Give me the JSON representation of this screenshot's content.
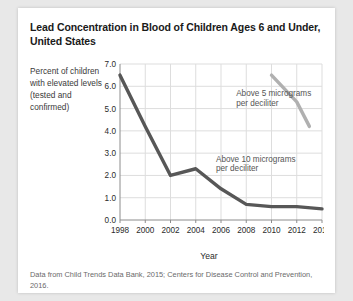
{
  "card": {
    "title": "Lead Concentration in Blood of Children Ages 6 and Under, United States",
    "source_note": "Data from Child Trends Data Bank, 2015; Centers for Disease Control and Prevention, 2016."
  },
  "chart_data": {
    "type": "line",
    "title": "Lead Concentration in Blood of Children Ages 6 and Under, United States",
    "xlabel": "Year",
    "ylabel": "Percent of children with elevated levels (tested and confirmed)",
    "xlim": [
      1998,
      2014
    ],
    "ylim": [
      0.0,
      7.0
    ],
    "grid": true,
    "legend_position": "inline-annotations",
    "x_ticks": [
      "1998",
      "2000",
      "2002",
      "2004",
      "2006",
      "2008",
      "2010",
      "2012",
      "2014"
    ],
    "y_ticks": [
      "0.0",
      "1.0",
      "2.0",
      "3.0",
      "4.0",
      "5.0",
      "6.0",
      "7.0"
    ],
    "series": [
      {
        "name": "Above 10 micrograms per deciliter",
        "color": "#575757",
        "annotation": "Above 10 micrograms per deciliter",
        "x": [
          1998,
          2000,
          2002,
          2004,
          2006,
          2008,
          2010,
          2012,
          2014
        ],
        "values": [
          6.5,
          4.2,
          2.0,
          2.3,
          1.4,
          0.7,
          0.6,
          0.6,
          0.5
        ]
      },
      {
        "name": "Above 5 micrograms per deciliter",
        "color": "#b0b0b0",
        "annotation": "Above 5 micrograms per deciliter",
        "x": [
          2010,
          2012,
          2013
        ],
        "values": [
          6.5,
          5.3,
          4.2
        ]
      }
    ],
    "annotations": [
      {
        "text_line1": "Above 5 micrograms",
        "text_line2": "per deciliter",
        "x": 2007.2,
        "y": 5.55
      },
      {
        "text_line1": "Above 10 micrograms",
        "text_line2": "per deciliter",
        "x": 2005.6,
        "y": 2.62
      }
    ]
  }
}
